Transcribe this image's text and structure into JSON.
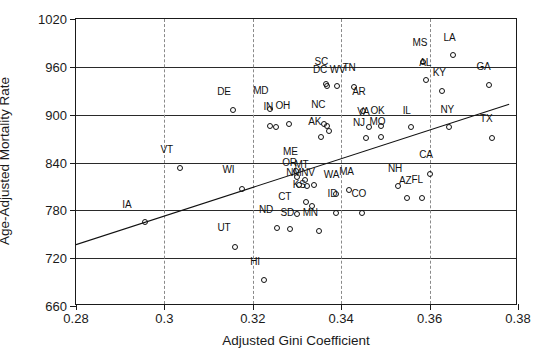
{
  "chart_data": {
    "type": "scatter",
    "title": "",
    "xlabel": "Adjusted Gini Coefficient",
    "ylabel": "Age-Adjusted Mortality Rate",
    "xlim": [
      0.28,
      0.38
    ],
    "ylim": [
      660,
      1020
    ],
    "xticks": [
      "0.28",
      "0.3",
      "0.32",
      "0.34",
      "0.36",
      "0.38"
    ],
    "xtick_values": [
      0.28,
      0.3,
      0.32,
      0.34,
      0.36,
      0.38
    ],
    "yticks": [
      "660",
      "720",
      "780",
      "840",
      "900",
      "960",
      "1020"
    ],
    "ytick_values": [
      660,
      720,
      780,
      840,
      900,
      960,
      1020
    ],
    "grid": "horizontal solid, vertical dashed",
    "legend": "none",
    "trendline": {
      "label": "regression line",
      "x0": 0.28,
      "y0": 737,
      "x1": 0.378,
      "y1": 913
    },
    "points": [
      {
        "label": "IA",
        "x": 0.2955,
        "y": 765,
        "lx": 0.2915,
        "ly": 781
      },
      {
        "label": "VT",
        "x": 0.3035,
        "y": 833,
        "lx": 0.3005,
        "ly": 850
      },
      {
        "label": "DE",
        "x": 0.3155,
        "y": 906,
        "lx": 0.3135,
        "ly": 922
      },
      {
        "label": "WI",
        "x": 0.3175,
        "y": 807,
        "lx": 0.3145,
        "ly": 824
      },
      {
        "label": "UT",
        "x": 0.316,
        "y": 734,
        "lx": 0.3135,
        "ly": 751
      },
      {
        "label": "HI",
        "x": 0.3225,
        "y": 692,
        "lx": 0.3205,
        "ly": 709
      },
      {
        "label": "ND",
        "x": 0.3255,
        "y": 758,
        "lx": 0.323,
        "ly": 774
      },
      {
        "label": "SD",
        "x": 0.3285,
        "y": 757,
        "lx": 0.3278,
        "ly": 771
      },
      {
        "label": "CT",
        "x": 0.33,
        "y": 775,
        "lx": 0.3272,
        "ly": 791
      },
      {
        "label": "MD",
        "x": 0.324,
        "y": 907,
        "lx": 0.3218,
        "ly": 923
      },
      {
        "label": "KS",
        "x": 0.332,
        "y": 790,
        "lx": 0.3305,
        "ly": 806
      },
      {
        "label": "KS2",
        "x": 0.3335,
        "y": 785,
        "lx": null,
        "ly": null
      },
      {
        "label": "MN",
        "x": 0.335,
        "y": 754,
        "lx": 0.333,
        "ly": 771
      },
      {
        "label": "ME",
        "x": 0.3298,
        "y": 829,
        "lx": 0.3285,
        "ly": 847
      },
      {
        "label": "OR",
        "x": 0.33,
        "y": 822,
        "lx": 0.3283,
        "ly": 833
      },
      {
        "label": "MT",
        "x": 0.3318,
        "y": 818,
        "lx": 0.331,
        "ly": 830
      },
      {
        "label": "NM",
        "x": 0.3305,
        "y": 812,
        "lx": 0.3293,
        "ly": 820
      },
      {
        "label": "NV",
        "x": 0.3322,
        "y": 811,
        "lx": 0.3325,
        "ly": 820
      },
      {
        "label": "NE",
        "x": 0.3338,
        "y": 812,
        "lx": null,
        "ly": null
      },
      {
        "label": "IN",
        "x": 0.3238,
        "y": 886,
        "lx": 0.3235,
        "ly": 903
      },
      {
        "label": "IN2",
        "x": 0.3252,
        "y": 884,
        "lx": null,
        "ly": null
      },
      {
        "label": "OH",
        "x": 0.3282,
        "y": 888,
        "lx": 0.3268,
        "ly": 904
      },
      {
        "label": "SC",
        "x": 0.3365,
        "y": 938,
        "lx": 0.3355,
        "ly": 960
      },
      {
        "label": "DC",
        "x": 0.3368,
        "y": 936,
        "lx": 0.3352,
        "ly": 950
      },
      {
        "label": "WV",
        "x": 0.339,
        "y": 936,
        "lx": 0.3392,
        "ly": 950
      },
      {
        "label": "TN",
        "x": 0.3428,
        "y": 935,
        "lx": 0.3418,
        "ly": 952
      },
      {
        "label": "NC",
        "x": 0.336,
        "y": 888,
        "lx": 0.3348,
        "ly": 906
      },
      {
        "label": "MI",
        "x": 0.3368,
        "y": 886,
        "lx": null,
        "ly": null
      },
      {
        "label": "AK",
        "x": 0.3355,
        "y": 872,
        "lx": 0.334,
        "ly": 884
      },
      {
        "label": "IO",
        "x": 0.3372,
        "y": 879,
        "lx": null,
        "ly": null
      },
      {
        "label": "AR",
        "x": 0.345,
        "y": 905,
        "lx": 0.344,
        "ly": 922
      },
      {
        "label": "VA",
        "x": 0.3462,
        "y": 885,
        "lx": 0.345,
        "ly": 897
      },
      {
        "label": "OK",
        "x": 0.349,
        "y": 886,
        "lx": 0.3482,
        "ly": 898
      },
      {
        "label": "NJ",
        "x": 0.3455,
        "y": 871,
        "lx": 0.344,
        "ly": 883
      },
      {
        "label": "MO",
        "x": 0.349,
        "y": 872,
        "lx": 0.3482,
        "ly": 884
      },
      {
        "label": "WA",
        "x": 0.3388,
        "y": 801,
        "lx": 0.3378,
        "ly": 818
      },
      {
        "label": "MA",
        "x": 0.3418,
        "y": 805,
        "lx": 0.3412,
        "ly": 822
      },
      {
        "label": "ID",
        "x": 0.3388,
        "y": 777,
        "lx": 0.338,
        "ly": 794
      },
      {
        "label": "CO",
        "x": 0.3448,
        "y": 777,
        "lx": 0.344,
        "ly": 794
      },
      {
        "label": "IL",
        "x": 0.3558,
        "y": 884,
        "lx": 0.3548,
        "ly": 898
      },
      {
        "label": "MS",
        "x": 0.3585,
        "y": 966,
        "lx": 0.3578,
        "ly": 983
      },
      {
        "label": "AL",
        "x": 0.3592,
        "y": 943,
        "lx": 0.359,
        "ly": 958
      },
      {
        "label": "LA",
        "x": 0.3652,
        "y": 975,
        "lx": 0.3645,
        "ly": 990
      },
      {
        "label": "KY",
        "x": 0.3628,
        "y": 930,
        "lx": 0.3622,
        "ly": 946
      },
      {
        "label": "NY",
        "x": 0.3645,
        "y": 884,
        "lx": 0.364,
        "ly": 899
      },
      {
        "label": "GA",
        "x": 0.3735,
        "y": 937,
        "lx": 0.3722,
        "ly": 954
      },
      {
        "label": "TX",
        "x": 0.3742,
        "y": 871,
        "lx": 0.3728,
        "ly": 888
      },
      {
        "label": "CA",
        "x": 0.3602,
        "y": 826,
        "lx": 0.3592,
        "ly": 843
      },
      {
        "label": "NH",
        "x": 0.3528,
        "y": 810,
        "lx": 0.3522,
        "ly": 825
      },
      {
        "label": "AZ",
        "x": 0.3548,
        "y": 796,
        "lx": 0.3545,
        "ly": 811
      },
      {
        "label": "FL",
        "x": 0.3582,
        "y": 795,
        "lx": 0.3572,
        "ly": 812
      }
    ]
  },
  "axes": {
    "x_title": "Adjusted Gini Coefficient",
    "y_title": "Age-Adjusted Mortality Rate"
  }
}
